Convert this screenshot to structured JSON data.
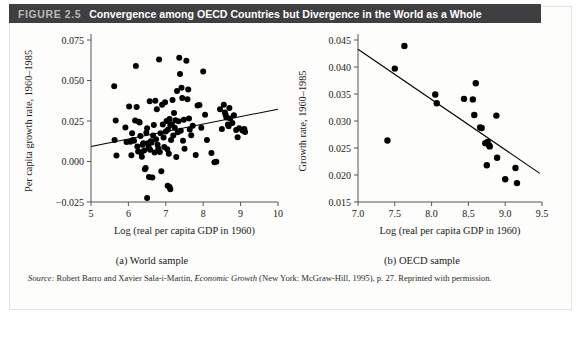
{
  "header": {
    "figure_number": "FIGURE 2.5",
    "title": "Convergence among OECD Countries but Divergence in the World as a Whole",
    "bar_color": "#3f3f41",
    "number_color": "#b9b9b6",
    "title_color": "#ffffff"
  },
  "source": {
    "label": "Source:",
    "authors": " Robert Barro and Xavier Sala-i-Martin, ",
    "book": "Economic Growth",
    "rest": " (New York: McGraw-Hill, 1995), p. 27. Reprinted with permission."
  },
  "chart_data": [
    {
      "type": "scatter",
      "id": "world-sample",
      "title": "",
      "caption": "(a) World sample",
      "xlabel": "Log (real per capita GDP in 1960)",
      "ylabel": "Per capita growth rate, 1960–1985",
      "xlim": [
        5,
        10
      ],
      "ylim": [
        -0.025,
        0.075
      ],
      "xticks": [
        5,
        6,
        7,
        8,
        9,
        10
      ],
      "xticklabels": [
        "5",
        "6",
        "7",
        "8",
        "9",
        "10"
      ],
      "yticks": [
        -0.025,
        0.0,
        0.025,
        0.05,
        0.075
      ],
      "yticklabels": [
        "−0.025",
        "0.000",
        "0.025",
        "0.050",
        "0.075"
      ],
      "grid": false,
      "legend": "none",
      "marker_color": "#000000",
      "marker_size": 3.0,
      "trendline": {
        "x": [
          5.0,
          10.0
        ],
        "y": [
          0.0093,
          0.0323
        ],
        "color": "#000000",
        "width": 1.1
      },
      "points": [
        [
          5.62,
          0.0464
        ],
        [
          5.66,
          0.0253
        ],
        [
          5.63,
          0.0133
        ],
        [
          5.68,
          0.0037
        ],
        [
          5.92,
          0.021
        ],
        [
          5.95,
          0.012
        ],
        [
          6.02,
          0.034
        ],
        [
          6.05,
          0.0122
        ],
        [
          6.08,
          0.0038
        ],
        [
          6.1,
          0.0175
        ],
        [
          6.12,
          0.0132
        ],
        [
          6.15,
          0.0128
        ],
        [
          6.18,
          0.0253
        ],
        [
          6.2,
          0.059
        ],
        [
          6.22,
          0.0337
        ],
        [
          6.24,
          0.0092
        ],
        [
          6.26,
          0.0062
        ],
        [
          6.28,
          0.0245
        ],
        [
          6.3,
          0.024
        ],
        [
          6.32,
          0.0158
        ],
        [
          6.34,
          0.0055
        ],
        [
          6.36,
          0.003
        ],
        [
          6.38,
          0.0103
        ],
        [
          6.4,
          0.0112
        ],
        [
          6.42,
          0.0068
        ],
        [
          6.44,
          -0.0048
        ],
        [
          6.46,
          -0.004
        ],
        [
          6.48,
          0.0178
        ],
        [
          6.5,
          0.0205
        ],
        [
          6.5,
          -0.0225
        ],
        [
          6.52,
          0.0113
        ],
        [
          6.54,
          0.009
        ],
        [
          6.55,
          -0.0095
        ],
        [
          6.57,
          0.0372
        ],
        [
          6.58,
          0.0072
        ],
        [
          6.6,
          0.0125
        ],
        [
          6.62,
          0.0118
        ],
        [
          6.64,
          -0.0098
        ],
        [
          6.66,
          0.016
        ],
        [
          6.68,
          0.0225
        ],
        [
          6.7,
          0.0055
        ],
        [
          6.72,
          0.0375
        ],
        [
          6.74,
          0.0138
        ],
        [
          6.76,
          0.0322
        ],
        [
          6.78,
          0.0104
        ],
        [
          6.8,
          0.0078
        ],
        [
          6.82,
          0.063
        ],
        [
          6.84,
          0.0058
        ],
        [
          6.86,
          0.0175
        ],
        [
          6.88,
          -0.006
        ],
        [
          6.9,
          0.035
        ],
        [
          6.92,
          0.0228
        ],
        [
          6.94,
          0.0148
        ],
        [
          6.96,
          0.009
        ],
        [
          6.98,
          0.0365
        ],
        [
          7.0,
          0.0185
        ],
        [
          7.02,
          0.025
        ],
        [
          7.04,
          0.0075
        ],
        [
          7.05,
          -0.015
        ],
        [
          7.06,
          0.0198
        ],
        [
          7.08,
          0.0048
        ],
        [
          7.1,
          0.0262
        ],
        [
          7.1,
          -0.0158
        ],
        [
          7.12,
          0.0225
        ],
        [
          7.12,
          -0.0172
        ],
        [
          7.14,
          0.0132
        ],
        [
          7.16,
          0.023
        ],
        [
          7.18,
          0.038
        ],
        [
          7.2,
          0.016
        ],
        [
          7.22,
          0.03
        ],
        [
          7.24,
          0.0208
        ],
        [
          7.26,
          0.0255
        ],
        [
          7.28,
          0.0028
        ],
        [
          7.3,
          0.0435
        ],
        [
          7.32,
          0.018
        ],
        [
          7.34,
          0.0248
        ],
        [
          7.36,
          0.064
        ],
        [
          7.38,
          0.054
        ],
        [
          7.4,
          0.019
        ],
        [
          7.42,
          0.0455
        ],
        [
          7.44,
          0.0392
        ],
        [
          7.46,
          0.0128
        ],
        [
          7.48,
          0.0258
        ],
        [
          7.5,
          0.0078
        ],
        [
          7.55,
          0.0622
        ],
        [
          7.58,
          0.0385
        ],
        [
          7.6,
          0.0445
        ],
        [
          7.62,
          0.0265
        ],
        [
          7.64,
          0.0198
        ],
        [
          7.68,
          0.0162
        ],
        [
          7.72,
          0.022
        ],
        [
          7.8,
          0.004
        ],
        [
          7.85,
          0.0345
        ],
        [
          7.9,
          0.0348
        ],
        [
          7.95,
          0.0208
        ],
        [
          8.0,
          0.0555
        ],
        [
          8.05,
          0.0288
        ],
        [
          8.1,
          0.0132
        ],
        [
          8.22,
          0.0053
        ],
        [
          8.3,
          -0.0005
        ],
        [
          8.45,
          0.0322
        ],
        [
          8.5,
          0.02
        ],
        [
          8.55,
          0.035
        ],
        [
          8.58,
          0.0302
        ],
        [
          8.6,
          0.0288
        ],
        [
          8.62,
          0.0272
        ],
        [
          8.66,
          0.0228
        ],
        [
          8.68,
          0.0218
        ],
        [
          8.7,
          0.033
        ],
        [
          8.72,
          0.0265
        ],
        [
          8.78,
          0.0238
        ],
        [
          8.82,
          0.0285
        ],
        [
          8.88,
          0.0195
        ],
        [
          8.92,
          0.015
        ],
        [
          8.96,
          0.0205
        ],
        [
          9.05,
          0.0192
        ],
        [
          9.1,
          0.02
        ],
        [
          9.12,
          0.0182
        ],
        [
          8.35,
          -0.0002
        ]
      ]
    },
    {
      "type": "scatter",
      "id": "oecd-sample",
      "title": "",
      "caption": "(b) OECD sample",
      "xlabel": "Log (real per capita GDP in 1960)",
      "ylabel": "Growth rate, 1960–1985",
      "xlim": [
        7.0,
        9.5
      ],
      "ylim": [
        0.015,
        0.045
      ],
      "xticks": [
        7.0,
        7.5,
        8.0,
        8.5,
        9.0,
        9.5
      ],
      "xticklabels": [
        "7.0",
        "7.5",
        "8.0",
        "8.5",
        "9.0",
        "9.5"
      ],
      "yticks": [
        0.015,
        0.02,
        0.025,
        0.03,
        0.035,
        0.04,
        0.045
      ],
      "yticklabels": [
        "0.015",
        "0.020",
        "0.025",
        "0.030",
        "0.035",
        "0.040",
        "0.045"
      ],
      "grid": false,
      "legend": "none",
      "marker_color": "#000000",
      "marker_size": 3.2,
      "trendline": {
        "x": [
          7.0,
          9.47
        ],
        "y": [
          0.0433,
          0.0203
        ],
        "color": "#000000",
        "width": 1.1
      },
      "points": [
        [
          7.4,
          0.0264
        ],
        [
          7.5,
          0.0397
        ],
        [
          7.63,
          0.0439
        ],
        [
          8.05,
          0.0349
        ],
        [
          8.07,
          0.0333
        ],
        [
          8.44,
          0.0341
        ],
        [
          8.56,
          0.034
        ],
        [
          8.6,
          0.037
        ],
        [
          8.58,
          0.0311
        ],
        [
          8.66,
          0.0288
        ],
        [
          8.68,
          0.0287
        ],
        [
          8.73,
          0.0259
        ],
        [
          8.76,
          0.0261
        ],
        [
          8.78,
          0.0255
        ],
        [
          8.79,
          0.0253
        ],
        [
          8.75,
          0.0218
        ],
        [
          8.88,
          0.031
        ],
        [
          8.89,
          0.0232
        ],
        [
          9.0,
          0.0192
        ],
        [
          9.14,
          0.0213
        ],
        [
          9.16,
          0.0185
        ]
      ]
    }
  ]
}
